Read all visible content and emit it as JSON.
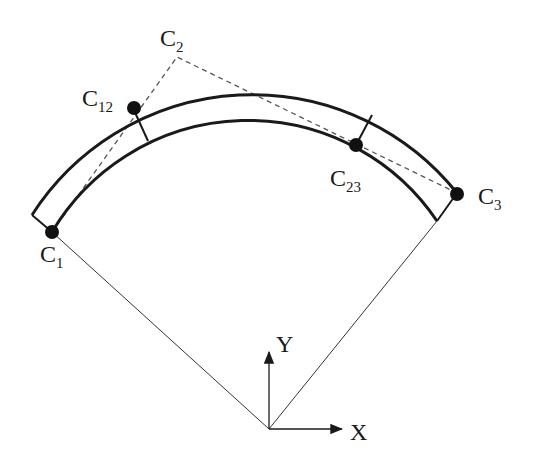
{
  "diagram": {
    "type": "curved-segment-control-points",
    "labels": {
      "c1": {
        "main": "C",
        "sub": "1"
      },
      "c12": {
        "main": "C",
        "sub": "12"
      },
      "c2": {
        "main": "C",
        "sub": "2"
      },
      "c23": {
        "main": "C",
        "sub": "23"
      },
      "c3": {
        "main": "C",
        "sub": "3"
      },
      "axis_x": "X",
      "axis_y": "Y"
    },
    "colors": {
      "stroke": "#1a1a1a",
      "dashed": "#555555",
      "background": "#ffffff"
    }
  }
}
